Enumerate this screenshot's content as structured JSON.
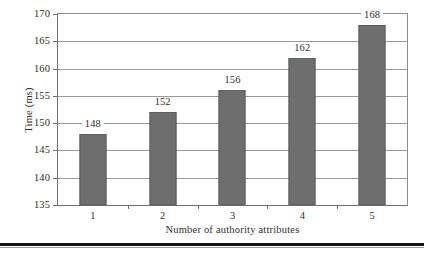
{
  "chart_data": {
    "type": "bar",
    "title": "",
    "categories": [
      "1",
      "2",
      "3",
      "4",
      "5"
    ],
    "values": [
      148,
      152,
      156,
      162,
      168
    ],
    "data_labels": [
      "148",
      "152",
      "156",
      "162",
      "168"
    ],
    "xlabel": "Number of authority attributes",
    "ylabel": "Time (ms)",
    "ylim": [
      135,
      170
    ],
    "ytick_step": 5,
    "yticks": [
      135,
      140,
      145,
      150,
      155,
      160,
      165,
      170
    ],
    "ytick_labels": [
      "135",
      "140",
      "145",
      "150",
      "155",
      "160",
      "165",
      "170"
    ],
    "grid": true,
    "grid_axis": "y",
    "legend": false,
    "legend_position": "none",
    "series": [
      {
        "name": "Time (ms)",
        "values": [
          148,
          152,
          156,
          162,
          168
        ],
        "color": "#6e6e6e"
      }
    ],
    "colors": {
      "bar_fill": "#6e6e6e",
      "bar_edge": "#5e5e5e",
      "gridline": "#9a9a9a",
      "axis": "#6f6f6f",
      "text": "#2e2e2e",
      "background": "#ffffff",
      "footer_rule": "#141414"
    }
  }
}
